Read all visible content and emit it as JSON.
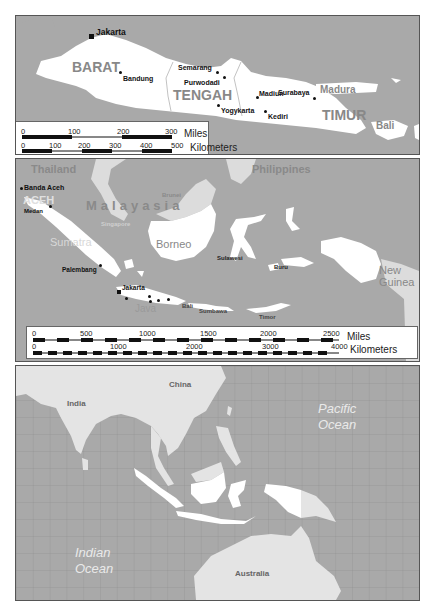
{
  "panels": {
    "java": {
      "cities": {
        "jakarta": "Jakarta",
        "bandung": "Bandung",
        "semarang": "Semarang",
        "purwodadi": "Purwodadi",
        "yogykarta": "Yogykarta",
        "madiun": "Madiun",
        "kediri": "Kediri",
        "surabaya": "Surabaya"
      },
      "regions": {
        "barat": "BARAT",
        "tengah": "TENGAH",
        "timur": "TIMUR",
        "madura": "Madura",
        "bali": "Bali"
      },
      "scale": {
        "miles_ticks": [
          "0",
          "100",
          "200",
          "300"
        ],
        "miles_unit": "Miles",
        "km_ticks": [
          "0",
          "100",
          "200",
          "300",
          "400",
          "500"
        ],
        "km_unit": "Kilometers"
      }
    },
    "indonesia": {
      "countries": {
        "thailand": "Thailand",
        "philippines": "Philippines",
        "malaysia": "Malayasia",
        "brunei": "Brunei",
        "singapore": "Singapore"
      },
      "regions": {
        "aceh": "ACEH",
        "sumatra": "Sumatra",
        "borneo": "Borneo",
        "java": "Java",
        "new_guinea_1": "New",
        "new_guinea_2": "Guinea"
      },
      "cities": {
        "banda_aceh": "Banda Aceh",
        "medan": "Medan",
        "palembang": "Palembang",
        "jakarta": "Jakarta"
      },
      "islands": {
        "sulawesi": "Sulawesi",
        "buru": "Buru",
        "bali": "Bali",
        "sumbawa": "Sumbawa",
        "timor": "Timor"
      },
      "scale": {
        "miles_ticks": [
          "0",
          "500",
          "1000",
          "1500",
          "2000",
          "2500"
        ],
        "miles_unit": "Miles",
        "km_ticks": [
          "0",
          "1000",
          "2000",
          "3000",
          "4000"
        ],
        "km_unit": "Kilometers"
      }
    },
    "region": {
      "countries": {
        "china": "China",
        "india": "India",
        "australia": "Australia"
      },
      "oceans": {
        "pacific_1": "Pacific",
        "pacific_2": "Ocean",
        "indian_1": "Indian",
        "indian_2": "Ocean"
      }
    }
  },
  "colors": {
    "sea": "#a9a9a9",
    "indonesia_land": "#ffffff",
    "other_land": "#e4e4e4",
    "label_gray": "#888888",
    "grid": "#8f8f8f"
  }
}
